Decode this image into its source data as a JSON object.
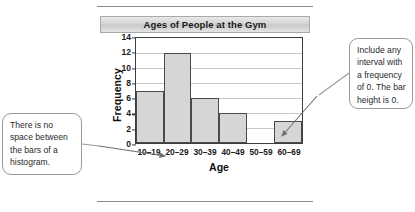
{
  "figure": {
    "chart_title": "Ages of People at the Gym",
    "x_axis_title": "Age",
    "y_axis_title": "Frequency"
  },
  "callouts": {
    "left": "There is no space between the bars of a histogram.",
    "right": "Include any interval with a frequency of 0. The bar height is 0."
  },
  "chart_data": {
    "type": "bar",
    "title": "Ages of People at the Gym",
    "xlabel": "Age",
    "ylabel": "Frequency",
    "categories": [
      "10–19",
      "20–29",
      "30–39",
      "40–49",
      "50–59",
      "60–69"
    ],
    "values": [
      7,
      12,
      6,
      4,
      0,
      3
    ],
    "ylim": [
      0,
      14
    ],
    "yticks": [
      0,
      2,
      4,
      6,
      8,
      10,
      12,
      14
    ],
    "grid": true,
    "legend": "none",
    "bar_gap": 0,
    "bar_fill": "#d6d6d6",
    "bar_stroke": "#4a4a4a"
  }
}
